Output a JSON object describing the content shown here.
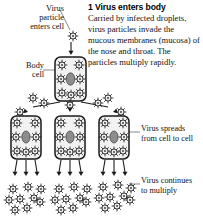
{
  "figure": {
    "kind": "medical-illustration",
    "background_color": "#ffffff",
    "ink_color": "#1a1a1a"
  },
  "step": {
    "number": "1",
    "title": "1 Virus enters body",
    "body": "Carried by infected droplets, virus particles invade the mucous membranes (mucosa) of the nose and throat. The particles multiply rapidly."
  },
  "labels": {
    "virus_particle": [
      "Virus",
      "particle",
      "enters cell"
    ],
    "body_cell": [
      "Body",
      "cell"
    ],
    "virus_spreads": [
      "Virus spreads",
      "from cell to cell"
    ],
    "virus_continues": [
      "Virus continues",
      "to multiply"
    ]
  },
  "icons": {
    "virus": "spiky-virus-particle-icon",
    "cell": "rounded-rect-cell-icon",
    "nucleus": "cell-nucleus-icon",
    "arrow": "down-arrow-icon",
    "leader": "leader-line"
  },
  "diagram": {
    "free_particle_top": {
      "cx": 73,
      "cy": 36,
      "r": 5.0
    },
    "cells": [
      {
        "name": "cell-top",
        "x": 55,
        "y": 56,
        "w": 31,
        "h": 45,
        "viruses": 7
      },
      {
        "name": "cell-mid-left",
        "x": 11,
        "y": 112,
        "w": 30,
        "h": 44,
        "viruses": 8
      },
      {
        "name": "cell-mid-center",
        "x": 55,
        "y": 112,
        "w": 30,
        "h": 44,
        "viruses": 8
      },
      {
        "name": "cell-mid-right",
        "x": 99,
        "y": 112,
        "w": 30,
        "h": 44,
        "viruses": 8
      }
    ],
    "particle_clusters": [
      {
        "name": "cluster-left",
        "cx": 28,
        "cy": 196,
        "count": 9
      },
      {
        "name": "cluster-center",
        "cx": 74,
        "cy": 196,
        "count": 9
      },
      {
        "name": "cluster-right",
        "cx": 120,
        "cy": 193,
        "count": 9
      }
    ],
    "arrows": {
      "entry": {
        "x": 71,
        "y1": 42,
        "y2": 55
      },
      "spread_count": 3,
      "release_rows": 3,
      "release_per_cell": 3
    },
    "leader_lines": [
      {
        "name": "leader-virus-particle",
        "x1": 60,
        "y1": 11,
        "x2": 70,
        "y2": 31
      },
      {
        "name": "leader-body-cell",
        "x1": 45,
        "y1": 70,
        "x2": 55,
        "y2": 70
      },
      {
        "name": "leader-spreads",
        "x1": 128,
        "y1": 133,
        "x2": 139,
        "y2": 133
      },
      {
        "name": "leader-multiply",
        "x1": 128,
        "y1": 185,
        "x2": 139,
        "y2": 185
      }
    ]
  }
}
